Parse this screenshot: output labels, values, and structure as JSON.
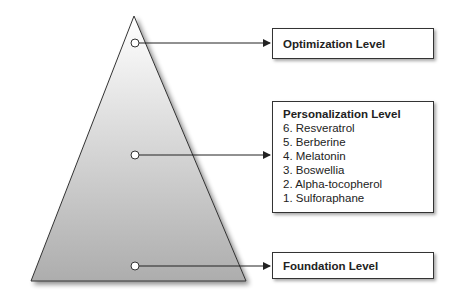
{
  "levels": {
    "optimization": {
      "title": "Optimization Level"
    },
    "personalization": {
      "title": "Personalization Level",
      "items": [
        "6. Resveratrol",
        "5. Berberine",
        "4. Melatonin",
        "3. Boswellia",
        "2. Alpha-tocopherol",
        "1. Sulforaphane"
      ]
    },
    "foundation": {
      "title": "Foundation Level"
    }
  },
  "colors": {
    "outline": "#333333",
    "gradient_top": "#ffffff",
    "gradient_bottom": "#b0b0b0"
  }
}
